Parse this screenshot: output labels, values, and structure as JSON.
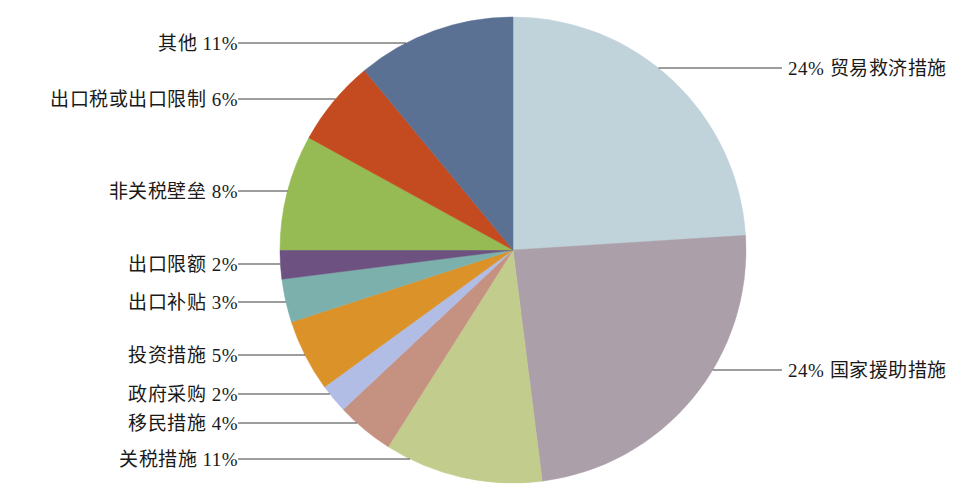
{
  "chart_data": {
    "type": "pie",
    "title": "",
    "subtitle": "",
    "xlabel": "",
    "ylabel": "",
    "legend_position": "callout-labels",
    "grid": false,
    "units": "percent",
    "start_angle_deg": 0,
    "direction": "clockwise",
    "total": 100,
    "categories": [
      "贸易救济措施",
      "国家援助措施",
      "关税措施",
      "移民措施",
      "政府采购",
      "投资措施",
      "出口补贴",
      "出口限额",
      "非关税壁垒",
      "出口税或出口限制",
      "其他"
    ],
    "values": [
      24,
      24,
      11,
      4,
      2,
      5,
      3,
      2,
      8,
      6,
      11
    ],
    "colors": [
      "#c1d3da",
      "#ab9fa9",
      "#c2cc8d",
      "#c59181",
      "#b1bde5",
      "#da9229",
      "#7cb0ac",
      "#6c5181",
      "#96bb55",
      "#c44b1f",
      "#5a7194"
    ],
    "slices": [
      {
        "label": "贸易救济措施",
        "value": 24,
        "display": "24% 贸易救济措施",
        "color": "#c1d3da",
        "side": "right"
      },
      {
        "label": "国家援助措施",
        "value": 24,
        "display": "24% 国家援助措施",
        "color": "#ab9fa9",
        "side": "right"
      },
      {
        "label": "关税措施",
        "value": 11,
        "display": "关税措施 11%",
        "color": "#c2cc8d",
        "side": "left"
      },
      {
        "label": "移民措施",
        "value": 4,
        "display": "移民措施 4%",
        "color": "#c59181",
        "side": "left"
      },
      {
        "label": "政府采购",
        "value": 2,
        "display": "政府采购 2%",
        "color": "#b1bde5",
        "side": "left"
      },
      {
        "label": "投资措施",
        "value": 5,
        "display": "投资措施 5%",
        "color": "#da9229",
        "side": "left"
      },
      {
        "label": "出口补贴",
        "value": 3,
        "display": "出口补贴 3%",
        "color": "#7cb0ac",
        "side": "left"
      },
      {
        "label": "出口限额",
        "value": 2,
        "display": "出口限额 2%",
        "color": "#6c5181",
        "side": "left"
      },
      {
        "label": "非关税壁垒",
        "value": 8,
        "display": "非关税壁垒 8%",
        "color": "#96bb55",
        "side": "left"
      },
      {
        "label": "出口税或出口限制",
        "value": 6,
        "display": "出口税或出口限制 6%",
        "color": "#c44b1f",
        "side": "left"
      },
      {
        "label": "其他",
        "value": 11,
        "display": "其他 11%",
        "color": "#5a7194",
        "side": "left"
      }
    ]
  },
  "callouts": {
    "left": [
      {
        "text": "其他 11%",
        "name": "callout-label-other"
      },
      {
        "text": "出口税或出口限制 6%",
        "name": "callout-label-export-tax-restriction"
      },
      {
        "text": "非关税壁垒 8%",
        "name": "callout-label-non-tariff-barrier"
      },
      {
        "text": "出口限额 2%",
        "name": "callout-label-export-quota"
      },
      {
        "text": "出口补贴 3%",
        "name": "callout-label-export-subsidy"
      },
      {
        "text": "投资措施 5%",
        "name": "callout-label-investment-measures"
      },
      {
        "text": "政府采购 2%",
        "name": "callout-label-government-procurement"
      },
      {
        "text": "移民措施 4%",
        "name": "callout-label-migration-measures"
      },
      {
        "text": "关税措施 11%",
        "name": "callout-label-tariff-measures"
      }
    ],
    "right": [
      {
        "text": "24% 贸易救济措施",
        "name": "callout-label-trade-remedy"
      },
      {
        "text": "24% 国家援助措施",
        "name": "callout-label-state-aid"
      }
    ]
  },
  "style": {
    "leader_line_color": "#3c3c3c",
    "background": "#ffffff",
    "text_color": "#1a1a1a"
  }
}
